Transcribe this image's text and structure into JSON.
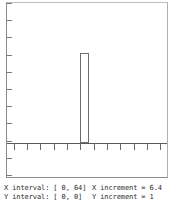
{
  "plot": {
    "background_color": "#ffffff",
    "frame_color": "#8b8b8b",
    "axis_color": "#5a5a5a",
    "bar_outline_color": "#6e6e6e"
  },
  "status": {
    "line1": {
      "interval_label": "X interval: [  0,  64]",
      "increment_label": "X increment = 6.4"
    },
    "line2": {
      "interval_label": "Y interval: [  0,   0]",
      "increment_label": "Y increment =   1"
    }
  },
  "chart_data": {
    "type": "bar",
    "title": "",
    "xlabel": "",
    "ylabel": "",
    "xlim": [
      0,
      64
    ],
    "ylim": [
      0,
      1
    ],
    "x_increment": 6.4,
    "y_increment": 1,
    "grid": false,
    "legend": null,
    "x_tick_count": 12,
    "y_tick_count": 11,
    "categories": [
      0,
      6.4,
      12.8,
      19.2,
      25.6,
      32,
      38.4,
      44.8,
      51.2,
      57.6,
      64
    ],
    "values": [
      0,
      0,
      0,
      0,
      0,
      1,
      0,
      0,
      0,
      0,
      0
    ],
    "bars": [
      {
        "x_left_pct": 45.7,
        "width_pct": 5.6,
        "height_pct": 52.0
      }
    ]
  }
}
